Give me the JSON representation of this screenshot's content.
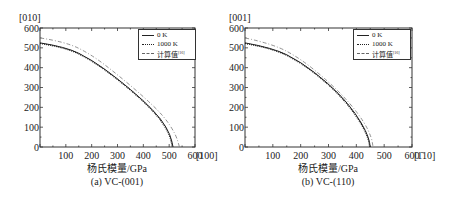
{
  "chart_data": [
    {
      "type": "line",
      "title": "",
      "caption": "(a) VC-(001)",
      "xlabel": "杨氏模量/GPa",
      "ylabel": "",
      "x_direction_label": "[100]",
      "y_direction_label": "[010]",
      "xlim": [
        0,
        600
      ],
      "ylim": [
        0,
        600
      ],
      "xticks": [
        100,
        200,
        300,
        400,
        500,
        600
      ],
      "yticks": [
        0,
        100,
        200,
        300,
        400,
        500,
        600
      ],
      "grid": false,
      "legend_position": "upper right",
      "legend": [
        "0 K",
        "1000 K",
        "计算值[16]"
      ],
      "series": [
        {
          "name": "0 K",
          "style": "solid",
          "x": [
            0,
            100,
            200,
            300,
            400,
            470,
            505,
            515
          ],
          "y": [
            525,
            505,
            440,
            345,
            235,
            140,
            60,
            0
          ]
        },
        {
          "name": "1000 K",
          "style": "dotted",
          "x": [
            0,
            100,
            200,
            300,
            400,
            468,
            503,
            512
          ],
          "y": [
            522,
            502,
            437,
            342,
            232,
            138,
            58,
            0
          ]
        },
        {
          "name": "计算值[16]",
          "style": "dashdot",
          "x": [
            0,
            100,
            200,
            300,
            400,
            480,
            525,
            540
          ],
          "y": [
            550,
            530,
            465,
            365,
            255,
            155,
            65,
            0
          ]
        }
      ]
    },
    {
      "type": "line",
      "title": "",
      "caption": "(b) VC-(110)",
      "xlabel": "杨氏模量/GPa",
      "ylabel": "",
      "x_direction_label": "[1̄10]",
      "y_direction_label": "[001]",
      "xlim": [
        0,
        600
      ],
      "ylim": [
        0,
        600
      ],
      "xticks": [
        100,
        200,
        300,
        400,
        500,
        600
      ],
      "yticks": [
        0,
        100,
        200,
        300,
        400,
        500,
        600
      ],
      "grid": false,
      "legend_position": "upper right",
      "legend": [
        "0 K",
        "1000 K",
        "计算值[16]"
      ],
      "series": [
        {
          "name": "0 K",
          "style": "solid",
          "x": [
            0,
            100,
            200,
            300,
            370,
            420,
            445,
            450
          ],
          "y": [
            525,
            500,
            430,
            320,
            220,
            120,
            45,
            0
          ]
        },
        {
          "name": "1000 K",
          "style": "dotted",
          "x": [
            0,
            100,
            200,
            300,
            368,
            418,
            443,
            448
          ],
          "y": [
            522,
            497,
            427,
            317,
            218,
            118,
            44,
            0
          ]
        },
        {
          "name": "计算值[16]",
          "style": "dashdot",
          "x": [
            0,
            100,
            200,
            300,
            375,
            430,
            455,
            460
          ],
          "y": [
            550,
            520,
            445,
            330,
            225,
            122,
            46,
            0
          ]
        }
      ]
    }
  ],
  "panels": [
    {
      "y_dir": "[010]",
      "x_dir": "[100]",
      "xlabel": "杨氏模量/GPa",
      "caption": "(a) VC-(001)",
      "legend": {
        "l0": "0 K",
        "l1": "1000 K",
        "l2": "计算值",
        "l2_sup": "[16]"
      }
    },
    {
      "y_dir": "[001]",
      "x_dir": "[1̄10]",
      "xlabel": "杨氏模量/GPa",
      "caption": "(b) VC-(110)",
      "legend": {
        "l0": "0 K",
        "l1": "1000 K",
        "l2": "计算值",
        "l2_sup": "[16]"
      }
    }
  ],
  "ticks": {
    "x": [
      "100",
      "200",
      "300",
      "400",
      "500",
      "600"
    ],
    "y": [
      "0",
      "100",
      "200",
      "300",
      "400",
      "500",
      "600"
    ]
  }
}
